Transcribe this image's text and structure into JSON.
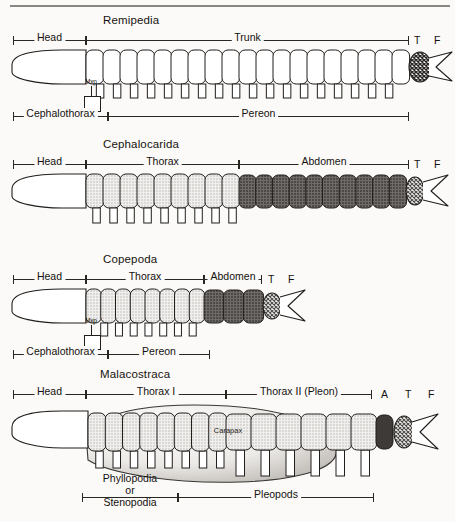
{
  "figure": {
    "kind": "comparative anatomy diagram"
  },
  "panels": [
    {
      "id": "remipedia",
      "title": "Remipedia",
      "top_brackets": [
        {
          "label": "Head"
        },
        {
          "label": "Trunk"
        }
      ],
      "top_letters": [
        "T",
        "F"
      ],
      "bottom_brackets": [
        {
          "label": "Cephalothorax"
        },
        {
          "label": "Pereon"
        }
      ],
      "segment_note": "Mxp",
      "body": {
        "trunk_segments": 19,
        "trunk_fill": "white",
        "leg_count": 18,
        "telson_fill": "crosshatch-dark"
      }
    },
    {
      "id": "cephalocarida",
      "title": "Cephalocarida",
      "top_brackets": [
        {
          "label": "Head"
        },
        {
          "label": "Thorax"
        },
        {
          "label": "Abdomen"
        }
      ],
      "top_letters": [
        "T",
        "F"
      ],
      "bottom_brackets": [],
      "segment_note": "",
      "body": {
        "thorax_segments": 9,
        "thorax_fill": "light-stipple",
        "abdomen_segments": 10,
        "abdomen_fill": "dark-stipple",
        "leg_count": 9,
        "telson_fill": "crosshatch-mid"
      }
    },
    {
      "id": "copepoda",
      "title": "Copepoda",
      "top_brackets": [
        {
          "label": "Head"
        },
        {
          "label": "Thorax"
        },
        {
          "label": "Abdomen"
        }
      ],
      "top_letters": [
        "T",
        "F"
      ],
      "bottom_brackets": [
        {
          "label": "Cephalothorax"
        },
        {
          "label": "Pereon"
        }
      ],
      "segment_note": "Mxp",
      "body": {
        "thorax_segments": 8,
        "thorax_fill": "light-stipple",
        "abdomen_segments": 3,
        "abdomen_fill": "dark-stipple",
        "leg_count": 7,
        "telson_fill": "crosshatch-mid"
      }
    },
    {
      "id": "malacostraca",
      "title": "Malacostraca",
      "top_brackets": [
        {
          "label": "Head"
        },
        {
          "label": "Thorax I"
        },
        {
          "label": "Thorax II (Pleon)"
        }
      ],
      "top_letters": [
        "A",
        "T",
        "F"
      ],
      "carapace_label": "Carapax",
      "bottom_brackets": [
        {
          "label": "Phyllopodia or Stenopodia",
          "line1": "Phyllopodia",
          "line2": "or",
          "line3": "Stenopodia"
        },
        {
          "label": "Pleopods"
        }
      ],
      "body": {
        "thorax1_segments": 8,
        "thorax1_fill": "light-stipple",
        "pleon_segments": 6,
        "pleon_fill": "light-stipple",
        "abdomen_segments": 1,
        "abdomen_fill": "dark-solid",
        "thoracic_legs": 8,
        "pleopods": 6,
        "telson_fill": "crosshatch-mid"
      }
    }
  ],
  "legend_abbreviations": {
    "T": "Telson",
    "F": "Furca",
    "A": "Abdomen",
    "Mxp": "Maxilliped"
  }
}
